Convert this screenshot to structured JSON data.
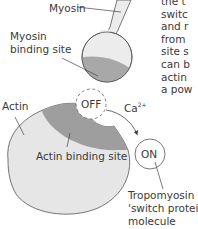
{
  "labels": {
    "myosin": "Myosin",
    "myosin_binding_site_line1": "Myosin",
    "myosin_binding_site_line2": "binding site",
    "actin": "Actin",
    "actin_binding_site": "Actin binding site",
    "off": "OFF",
    "on": "ON",
    "calcium": "Ca",
    "calcium_charge": "2+",
    "tropomyosin_line1": "Tropomyosin",
    "tropomyosin_line2": "'switch protein'",
    "tropomyosin_line3": "molecule"
  },
  "paragraph_fragment": [
    "the t",
    "switc",
    "and r",
    "from",
    "site s",
    "can b",
    "actin",
    "a pow"
  ],
  "colors": {
    "myosin_head_fill": "#ececec",
    "myosin_binding_fill": "#a8a8a8",
    "actin_fill": "#e6e6e6",
    "actin_binding_fill": "#9e9e9e",
    "outline": "#555555",
    "text": "#3a3a3a"
  }
}
